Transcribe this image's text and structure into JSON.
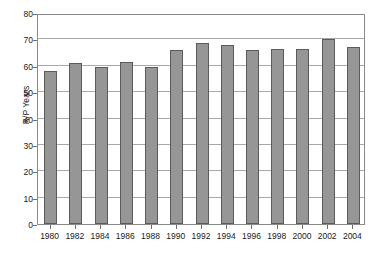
{
  "chart_data": {
    "type": "bar",
    "title": "",
    "subtitle": "",
    "xlabel": "",
    "ylabel": "R/P Years",
    "categories": [
      "1980",
      "1982",
      "1984",
      "1986",
      "1988",
      "1990",
      "1992",
      "1994",
      "1996",
      "1998",
      "2000",
      "2002",
      "2004"
    ],
    "values": [
      58,
      61,
      59.5,
      61.5,
      59.5,
      66,
      68.5,
      68,
      66,
      66.5,
      66.5,
      70,
      67
    ],
    "ylim": [
      0,
      80
    ],
    "ytick_labels": [
      "0",
      "10",
      "20",
      "30",
      "40",
      "50",
      "60",
      "70",
      "80"
    ],
    "ytick_values": [
      0,
      10,
      20,
      30,
      40,
      50,
      60,
      70,
      80
    ],
    "grid": true,
    "grid_axis": "y",
    "legend": null,
    "legend_position": "none",
    "annotations": [],
    "series": [
      {
        "name": "R/P Years",
        "values": [
          58,
          61,
          59.5,
          61.5,
          59.5,
          66,
          68.5,
          68,
          66,
          66.5,
          66.5,
          70,
          67
        ]
      }
    ],
    "colors": {
      "bar_fill": "#969696",
      "bar_border": "#5b5b5b",
      "grid": "#a8a8a8",
      "frame": "#8a8a8a",
      "text": "#1a1a1a",
      "background": "#ffffff"
    }
  }
}
